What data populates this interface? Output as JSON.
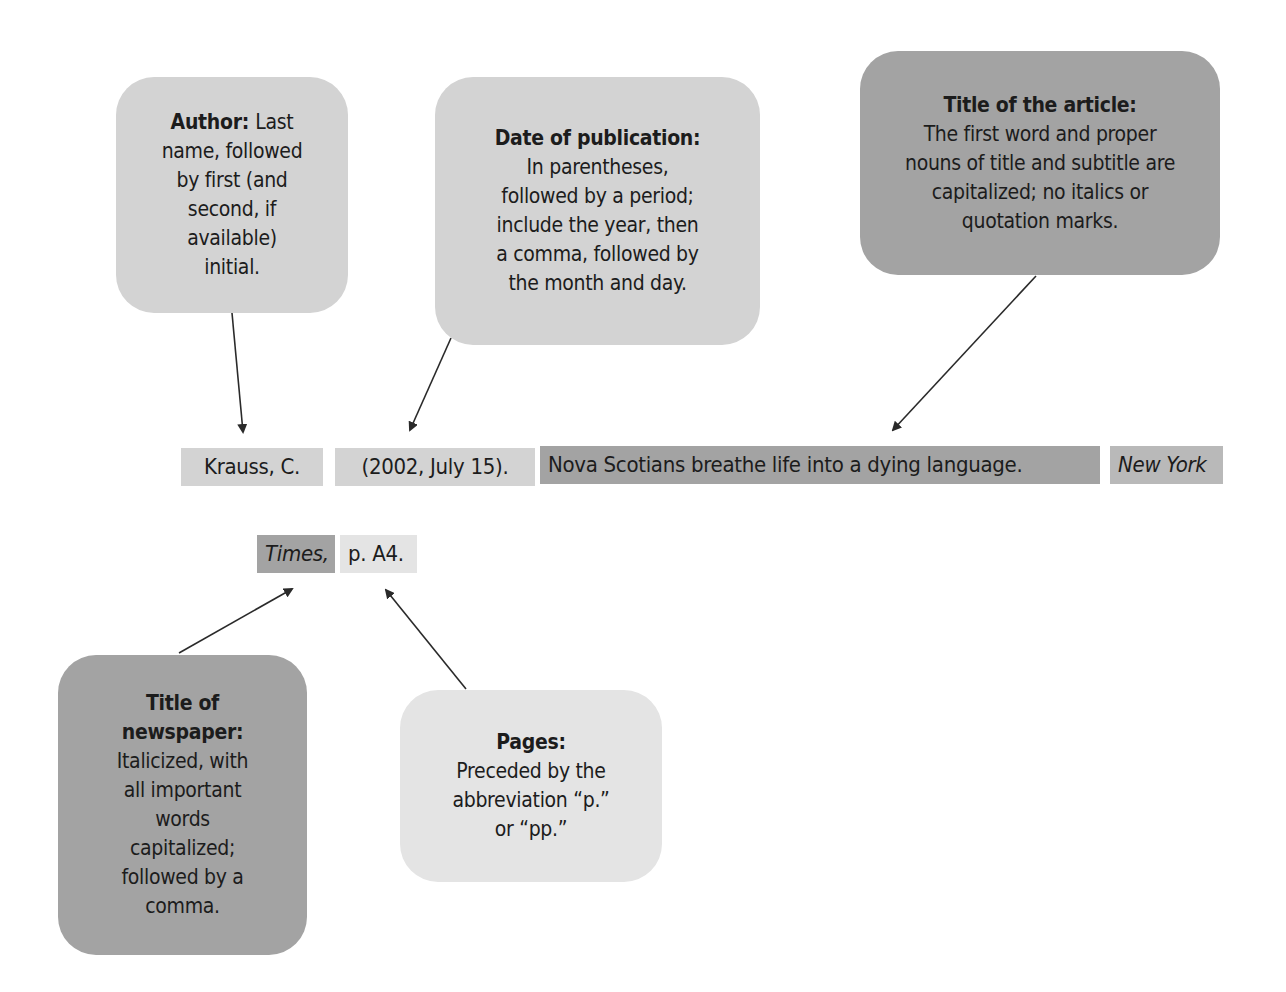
{
  "colors": {
    "author": "#d3d3d3",
    "date": "#d3d3d3",
    "article_title": "#a3a3a3",
    "newspaper_title": "#a3a3a3",
    "newspaper_segment": "#a3a3a3",
    "pages": "#e4e4e4",
    "arrow": "#2a2a2a"
  },
  "callouts": {
    "author": {
      "heading": "Author:",
      "lines": [
        "Last",
        "name, followed",
        "by first (and",
        "second, if",
        "available)",
        "initial."
      ]
    },
    "date": {
      "heading": "Date of publication:",
      "lines": [
        "In parentheses,",
        "followed by a period;",
        "include the year, then",
        "a comma, followed by",
        "the month and day."
      ]
    },
    "article_title": {
      "heading": "Title of the article:",
      "lines": [
        "The first word and proper",
        "nouns of title and subtitle are",
        "capitalized; no italics or",
        "quotation marks."
      ]
    },
    "newspaper_title": {
      "heading_lines": [
        "Title of",
        "newspaper:"
      ],
      "lines": [
        "Italicized, with",
        "all important",
        "words",
        "capitalized;",
        "followed by a",
        "comma."
      ]
    },
    "pages": {
      "heading": "Pages:",
      "lines": [
        "Preceded by the",
        "abbreviation “p.”",
        "or “pp.”"
      ]
    }
  },
  "citation": {
    "author": "Krauss, C.",
    "date": "(2002, July 15).",
    "article_title": "Nova Scotians breathe life into a dying language.",
    "newspaper_part1": "New York",
    "newspaper_part2": "Times,",
    "pages": "p. A4."
  }
}
